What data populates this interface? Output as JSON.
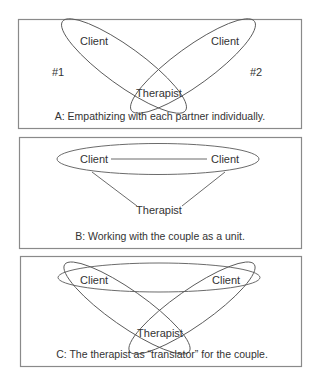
{
  "panels": [
    {
      "id": "A",
      "caption": "A: Empathizing with each partner individually.",
      "client_left": "Client",
      "client_right": "Client",
      "therapist": "Therapist",
      "marker_left": "#1",
      "marker_right": "#2"
    },
    {
      "id": "B",
      "caption": "B: Working with the couple as a unit.",
      "client_left": "Client",
      "client_right": "Client",
      "therapist": "Therapist"
    },
    {
      "id": "C",
      "caption": "C: The therapist as “translator” for the couple.",
      "client_left": "Client",
      "client_right": "Client",
      "therapist": "Therapist"
    }
  ],
  "colors": {
    "border": "#8a8a8a",
    "stroke": "#5a5a5a",
    "text": "#333333"
  }
}
